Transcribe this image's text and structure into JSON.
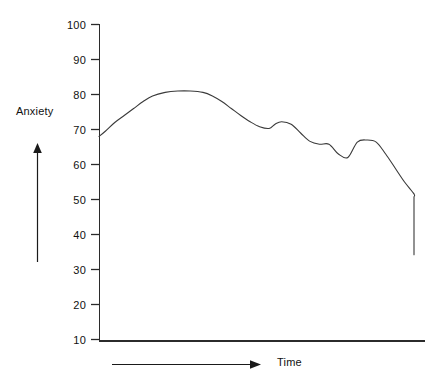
{
  "chart_data": {
    "type": "line",
    "title": "",
    "xlabel": "Time",
    "ylabel": "Anxiety",
    "ylim": [
      10,
      100
    ],
    "yticks": [
      100,
      90,
      80,
      70,
      60,
      50,
      40,
      30,
      20,
      10
    ],
    "ytick_labels": [
      "100",
      "90",
      "80",
      "70",
      "60",
      "50",
      "40",
      "30",
      "20",
      "10"
    ],
    "xticks": [],
    "xtick_labels": [],
    "grid": false,
    "legend": null,
    "axis_color": "#2b2b2b",
    "line_color": "#3a3a3a",
    "series": [
      {
        "name": "Anxiety",
        "x": [
          0.0,
          0.02,
          0.05,
          0.08,
          0.11,
          0.14,
          0.17,
          0.21,
          0.25,
          0.29,
          0.33,
          0.36,
          0.39,
          0.42,
          0.45,
          0.48,
          0.51,
          0.54,
          0.56,
          0.58,
          0.61,
          0.64,
          0.67,
          0.7,
          0.73,
          0.76,
          0.79,
          0.82,
          0.85,
          0.88,
          0.91,
          0.94,
          0.97,
          1.0
        ],
        "values": [
          68.0,
          69.5,
          72.0,
          74.0,
          76.0,
          78.0,
          79.6,
          80.6,
          81.0,
          81.0,
          80.6,
          79.6,
          78.0,
          76.0,
          74.0,
          72.2,
          70.8,
          70.3,
          71.6,
          72.2,
          71.5,
          69.0,
          66.6,
          65.8,
          65.8,
          63.0,
          62.0,
          66.4,
          67.0,
          66.4,
          63.0,
          59.0,
          55.0,
          51.6
        ],
        "values_tail": [
          50.8,
          50.6,
          50.0,
          48.4,
          47.6,
          48.0,
          46.0,
          43.5,
          41.0,
          38.6,
          36.5,
          34.2
        ]
      }
    ],
    "annotations": [
      {
        "name": "y-axis-direction-arrow",
        "direction": "up"
      },
      {
        "name": "x-axis-direction-arrow",
        "direction": "right"
      }
    ]
  },
  "labels": {
    "y_axis": "Anxiety",
    "x_axis": "Time"
  }
}
